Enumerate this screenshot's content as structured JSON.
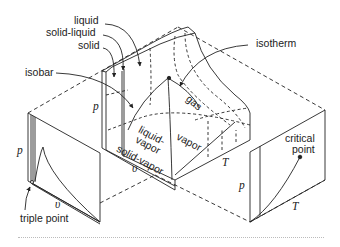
{
  "figure": {
    "type": "p-v-T surface diagram",
    "stroke_color": "#222222",
    "labels": {
      "liquid": "liquid",
      "solid_liquid": "solid-liquid",
      "solid": "solid",
      "isobar": "isobar",
      "isotherm": "isotherm",
      "gas": "gas",
      "liquid_vapor_1": "liquid-",
      "liquid_vapor_2": "vapor",
      "vapor": "vapor",
      "solid_vapor": "solid-vapor",
      "triple_point": "triple point",
      "critical_point_1": "critical",
      "critical_point_2": "point"
    },
    "axes": {
      "main_p": "p",
      "main_v": "υ",
      "main_T": "T",
      "pv_p": "p",
      "pv_v": "υ",
      "pT_p": "p",
      "pT_T": "T"
    },
    "projections": [
      {
        "name": "p-v diagram",
        "x_axis": "υ",
        "y_axis": "p",
        "annotation": "triple point"
      },
      {
        "name": "p-T diagram",
        "x_axis": "T",
        "y_axis": "p",
        "annotation": "critical point"
      }
    ]
  }
}
